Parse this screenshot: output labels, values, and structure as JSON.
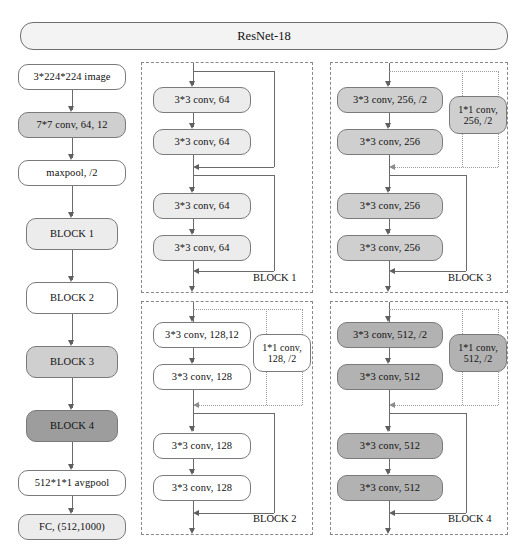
{
  "title": {
    "label": "ResNet-18"
  },
  "backbone": {
    "name": "main-pipeline",
    "nodes": [
      {
        "label": "3*224*224 image",
        "fill": "fill-white"
      },
      {
        "label": "7*7 conv, 64, 12",
        "fill": "fill-mid"
      },
      {
        "label": "maxpool, /2",
        "fill": "fill-white"
      },
      {
        "label": "BLOCK 1",
        "fill": "fill-light"
      },
      {
        "label": "BLOCK 2",
        "fill": "fill-white"
      },
      {
        "label": "BLOCK 3",
        "fill": "fill-mid"
      },
      {
        "label": "BLOCK 4",
        "fill": "fill-darker"
      },
      {
        "label": "512*1*1 avgpool",
        "fill": "fill-white"
      },
      {
        "label": "FC, (512,1000)",
        "fill": "fill-light"
      }
    ]
  },
  "blocks": [
    {
      "id": "block-1",
      "label": "BLOCK 1",
      "convs": [
        {
          "label": "3*3 conv, 64",
          "fill": "fill-light"
        },
        {
          "label": "3*3 conv, 64",
          "fill": "fill-light"
        },
        {
          "label": "3*3 conv, 64",
          "fill": "fill-light"
        },
        {
          "label": "3*3 conv, 64",
          "fill": "fill-light"
        }
      ],
      "shortcut": null
    },
    {
      "id": "block-2",
      "label": "BLOCK 2",
      "convs": [
        {
          "label": "3*3 conv, 128,12",
          "fill": "fill-white"
        },
        {
          "label": "3*3 conv, 128",
          "fill": "fill-white"
        },
        {
          "label": "3*3 conv, 128",
          "fill": "fill-white"
        },
        {
          "label": "3*3 conv, 128",
          "fill": "fill-white"
        }
      ],
      "shortcut": {
        "line1": "1*1 conv,",
        "line2": "128, /2",
        "fill": "fill-white"
      }
    },
    {
      "id": "block-3",
      "label": "BLOCK 3",
      "convs": [
        {
          "label": "3*3 conv, 256, /2",
          "fill": "fill-mid"
        },
        {
          "label": "3*3 conv, 256",
          "fill": "fill-mid"
        },
        {
          "label": "3*3 conv, 256",
          "fill": "fill-mid"
        },
        {
          "label": "3*3 conv, 256",
          "fill": "fill-mid"
        }
      ],
      "shortcut": {
        "line1": "1*1 conv,",
        "line2": "256, /2",
        "fill": "fill-mid"
      }
    },
    {
      "id": "block-4",
      "label": "BLOCK 4",
      "convs": [
        {
          "label": "3*3 conv, 512, /2",
          "fill": "fill-dark"
        },
        {
          "label": "3*3 conv, 512",
          "fill": "fill-dark"
        },
        {
          "label": "3*3 conv, 512",
          "fill": "fill-dark"
        },
        {
          "label": "3*3 conv, 512",
          "fill": "fill-dark"
        }
      ],
      "shortcut": {
        "line1": "1*1 conv,",
        "line2": "512, /2",
        "fill": "fill-dark"
      }
    }
  ],
  "colors": {
    "box_stroke": "#7a7a7a",
    "line": "#6b6b6b",
    "dotted_line": "#9a9a9a",
    "region_border": "#888888",
    "fill_white": "#ffffff",
    "fill_light": "#ececec",
    "fill_mid": "#cfcfcf",
    "fill_dark": "#b2b2b2",
    "fill_darker": "#9d9d9d",
    "title_fill": "#f3f3f3",
    "text": "#111111"
  }
}
